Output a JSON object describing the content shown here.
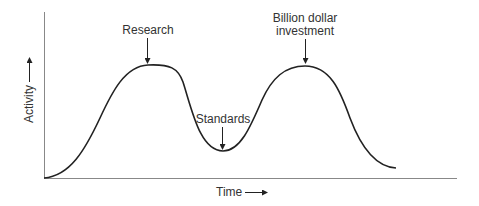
{
  "diagram": {
    "type": "hype-cycle-curve",
    "axes": {
      "x_label": "Time",
      "y_label": "Activity"
    },
    "annotations": [
      {
        "id": "research",
        "lines": [
          "Research"
        ]
      },
      {
        "id": "standards",
        "lines": [
          "Standards"
        ]
      },
      {
        "id": "investment",
        "lines": [
          "Billion dollar",
          "investment"
        ]
      }
    ],
    "colors": {
      "line": "#222222",
      "axis": "#888888",
      "text": "#333333",
      "background": "#ffffff"
    }
  }
}
